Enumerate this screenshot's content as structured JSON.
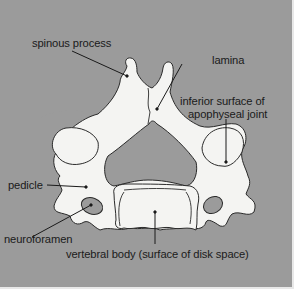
{
  "diagram": {
    "colors": {
      "background": "#9b9b9b",
      "bone": "#f4f4f2",
      "outline": "#2a2a2a",
      "label_text": "#1a1a1a",
      "border": "#e8e8e8"
    },
    "labels": {
      "spinous_process": "spinous process",
      "lamina": "lamina",
      "inferior_surface_line1": "inferior surface of",
      "inferior_surface_line2": "apophyseal joint",
      "pedicle": "pedicle",
      "neuroforamen": "neuroforamen",
      "vertebral_body": "vertebral body (surface of disk space)"
    }
  }
}
